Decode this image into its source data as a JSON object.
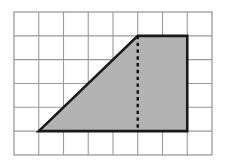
{
  "figure": {
    "background_color": "#ffffff",
    "width": 226,
    "height": 166
  },
  "grid": {
    "name": "square-grid",
    "columns": 8,
    "rows": 6,
    "origin_x": 14,
    "origin_y": 12,
    "cell_width": 24.75,
    "cell_height": 23.83,
    "line_color": "#9a9a9a",
    "line_width": 1.1,
    "border_color": "#9a9a9a",
    "border_width": 1.3
  },
  "shape": {
    "name": "trapezoid",
    "type": "trapezoid",
    "fill_color": "#b3b3b3",
    "stroke_color": "#1a1a1a",
    "stroke_width": 2.6,
    "vertices_grid": [
      {
        "label": "bottom-left",
        "col": 1,
        "row": 5
      },
      {
        "label": "top-left",
        "col": 5,
        "row": 1
      },
      {
        "label": "top-right",
        "col": 7,
        "row": 1
      },
      {
        "label": "bottom-right",
        "col": 7,
        "row": 5
      }
    ],
    "vertices_px": [
      {
        "label": "bottom-left",
        "x": 38.8,
        "y": 131.1
      },
      {
        "label": "top-left",
        "x": 137.8,
        "y": 35.8
      },
      {
        "label": "top-right",
        "x": 187.3,
        "y": 35.8
      },
      {
        "label": "bottom-right",
        "x": 187.3,
        "y": 131.1
      }
    ],
    "polygon_points": "38.8,131.1 137.8,35.8 187.3,35.8 187.3,131.1"
  },
  "altitude": {
    "name": "dashed-height-segment",
    "style": "dashed",
    "stroke_color": "#111111",
    "stroke_width": 2.4,
    "dash_pattern": "3.4,3.4",
    "from_px": {
      "x": 137.8,
      "y": 35.8
    },
    "to_px": {
      "x": 137.8,
      "y": 131.1
    },
    "from_grid": {
      "col": 5,
      "row": 1
    },
    "to_grid": {
      "col": 5,
      "row": 5
    },
    "length_cells": 4
  },
  "measurements": {
    "top_base_cells": 2,
    "bottom_base_cells": 6,
    "height_cells": 4,
    "area_cells": 16
  }
}
